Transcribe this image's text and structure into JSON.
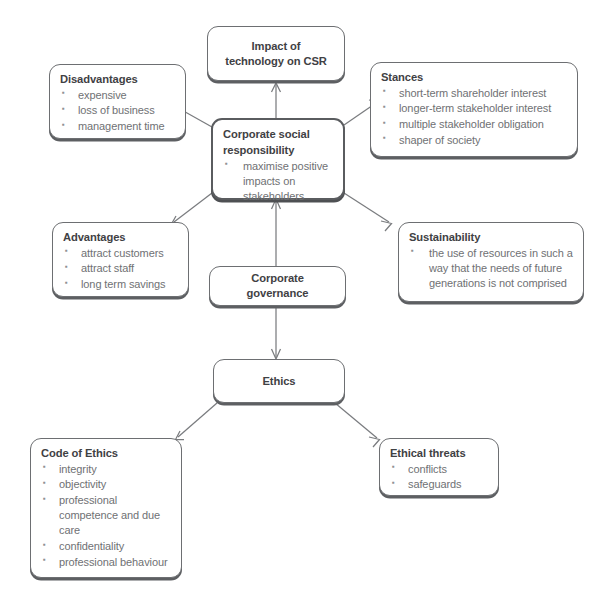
{
  "diagram": {
    "type": "mind-map",
    "colors": {
      "background": "#ffffff",
      "node_border": "#6d6f72",
      "node_border_emphasis": "#5a5c5f",
      "node_shadow": "#5d5f62",
      "title_text": "#3f4144",
      "body_text": "#6f7174",
      "bullet": "#8f9193",
      "connector": "#7a7c7f"
    }
  },
  "nodes": {
    "impact": {
      "title_line_1": "Impact of",
      "title_line_2": "technology on CSR"
    },
    "disadvantages": {
      "title": "Disadvantages",
      "bullets": [
        "expensive",
        "loss of business",
        "management time"
      ]
    },
    "stances": {
      "title": "Stances",
      "bullets": [
        "short-term shareholder interest",
        "longer-term stakeholder interest",
        "multiple stakeholder obligation",
        "shaper of society"
      ]
    },
    "csr": {
      "title_line_1": "Corporate social",
      "title_line_2": "responsibility",
      "bullets": [
        "maximise positive impacts on stakeholders"
      ]
    },
    "advantages": {
      "title": "Advantages",
      "bullets": [
        "attract customers",
        "attract staff",
        "long term savings"
      ]
    },
    "sustainability": {
      "title": "Sustainability",
      "bullets": [
        "the use of resources in such a way that the needs of future generations is not comprised"
      ]
    },
    "governance": {
      "title": "Corporate governance"
    },
    "ethics": {
      "title": "Ethics"
    },
    "code_of_ethics": {
      "title": "Code of Ethics",
      "bullets": [
        "integrity",
        "objectivity",
        "professional competence and due care",
        "confidentiality",
        "professional behaviour"
      ]
    },
    "ethical_threats": {
      "title": "Ethical threats",
      "bullets": [
        "conflicts",
        "safeguards"
      ]
    }
  },
  "connections": [
    {
      "from": "csr",
      "to": "impact",
      "style": "arrow"
    },
    {
      "from": "csr",
      "to": "disadvantages",
      "style": "arrow"
    },
    {
      "from": "csr",
      "to": "stances",
      "style": "arrow"
    },
    {
      "from": "csr",
      "to": "advantages",
      "style": "arrow"
    },
    {
      "from": "csr",
      "to": "sustainability",
      "style": "arrow"
    },
    {
      "from": "governance",
      "to": "csr",
      "style": "arrow"
    },
    {
      "from": "governance",
      "to": "ethics",
      "style": "arrow"
    },
    {
      "from": "ethics",
      "to": "code_of_ethics",
      "style": "arrow"
    },
    {
      "from": "ethics",
      "to": "ethical_threats",
      "style": "arrow"
    }
  ]
}
